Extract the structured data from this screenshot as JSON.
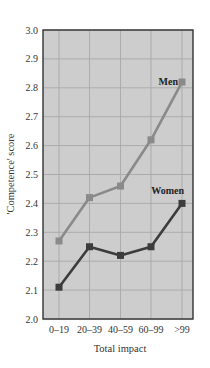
{
  "chart_data": {
    "type": "line",
    "title": "",
    "xlabel": "Total impact",
    "ylabel": "'Competence' score",
    "categories": [
      "0–19",
      "20–39",
      "40–59",
      "60–99",
      ">99"
    ],
    "ylim": [
      2.0,
      3.0
    ],
    "yticks": [
      "2.0",
      "2.1",
      "2.2",
      "2.3",
      "2.4",
      "2.5",
      "2.6",
      "2.7",
      "2.8",
      "2.9",
      "3.0"
    ],
    "grid": true,
    "legend": "inline labels",
    "series": [
      {
        "name": "Men",
        "values": [
          2.27,
          2.42,
          2.46,
          2.62,
          2.82
        ],
        "color": "#8a8a8a"
      },
      {
        "name": "Women",
        "values": [
          2.11,
          2.25,
          2.22,
          2.25,
          2.4
        ],
        "color": "#3c3c3c"
      }
    ]
  },
  "colors": {
    "plot_background": "#cdcdcd",
    "grid": "#a8a8a8",
    "frame": "#333333"
  }
}
